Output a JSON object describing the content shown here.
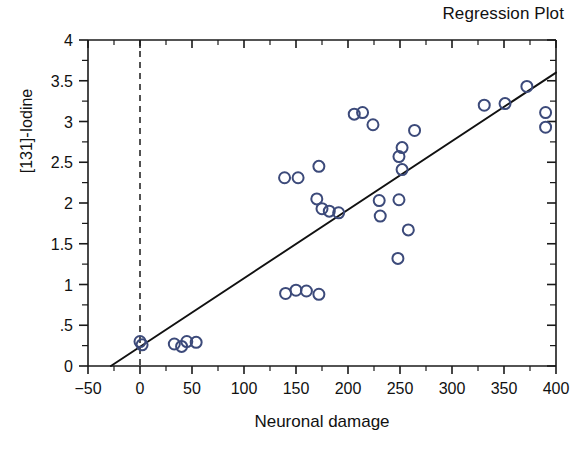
{
  "chart_data": {
    "type": "scatter",
    "title": "Regression Plot",
    "xlabel": "Neuronal damage",
    "ylabel": "[131]-Iodine",
    "xlim": [
      -50,
      400
    ],
    "ylim": [
      0,
      4
    ],
    "xticks": [
      -50,
      0,
      50,
      100,
      150,
      200,
      250,
      300,
      350,
      400
    ],
    "xticklabels": [
      "−50",
      "0",
      "50",
      "100",
      "150",
      "200",
      "250",
      "300",
      "350",
      "400"
    ],
    "yticks": [
      0,
      0.5,
      1,
      1.5,
      2,
      2.5,
      3,
      3.5,
      4
    ],
    "yticklabels": [
      "0",
      ".5",
      "1",
      "1.5",
      "2",
      "2.5",
      "3",
      "3.5",
      "4"
    ],
    "x_minor_tick_step": 25,
    "y_minor_tick_step": 0.25,
    "grid": false,
    "legend": false,
    "marker": "open-circle",
    "marker_color": "#3c4a7a",
    "marker_size": 11,
    "reference_line": {
      "orientation": "vertical",
      "value": 0,
      "style": "dashed",
      "color": "#1a1a1a"
    },
    "regression_line": {
      "color": "#111111",
      "style": "solid",
      "x_start": -28,
      "y_start": 0,
      "x_end": 400,
      "y_end": 3.6,
      "slope": 0.00841,
      "intercept": 0.2355
    },
    "points": [
      {
        "x": 0,
        "y": 0.3
      },
      {
        "x": 2,
        "y": 0.26
      },
      {
        "x": 33,
        "y": 0.27
      },
      {
        "x": 40,
        "y": 0.24
      },
      {
        "x": 45,
        "y": 0.3
      },
      {
        "x": 54,
        "y": 0.29
      },
      {
        "x": 140,
        "y": 0.89
      },
      {
        "x": 150,
        "y": 0.93
      },
      {
        "x": 160,
        "y": 0.92
      },
      {
        "x": 172,
        "y": 0.88
      },
      {
        "x": 139,
        "y": 2.31
      },
      {
        "x": 152,
        "y": 2.31
      },
      {
        "x": 172,
        "y": 2.45
      },
      {
        "x": 170,
        "y": 2.05
      },
      {
        "x": 175,
        "y": 1.93
      },
      {
        "x": 182,
        "y": 1.9
      },
      {
        "x": 191,
        "y": 1.88
      },
      {
        "x": 206,
        "y": 3.09
      },
      {
        "x": 214,
        "y": 3.11
      },
      {
        "x": 224,
        "y": 2.96
      },
      {
        "x": 230,
        "y": 2.03
      },
      {
        "x": 231,
        "y": 1.84
      },
      {
        "x": 249,
        "y": 2.57
      },
      {
        "x": 252,
        "y": 2.68
      },
      {
        "x": 252,
        "y": 2.41
      },
      {
        "x": 249,
        "y": 2.04
      },
      {
        "x": 264,
        "y": 2.89
      },
      {
        "x": 258,
        "y": 1.67
      },
      {
        "x": 248,
        "y": 1.32
      },
      {
        "x": 331,
        "y": 3.2
      },
      {
        "x": 351,
        "y": 3.22
      },
      {
        "x": 372,
        "y": 3.43
      },
      {
        "x": 390,
        "y": 3.11
      },
      {
        "x": 390,
        "y": 2.93
      }
    ]
  }
}
